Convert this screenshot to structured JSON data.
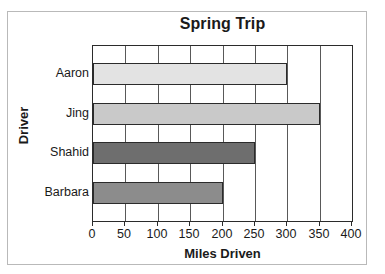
{
  "chart_data": {
    "type": "bar",
    "orientation": "horizontal",
    "title": "Spring Trip",
    "xlabel": "Miles Driven",
    "ylabel": "Driver",
    "categories": [
      "Aaron",
      "Jing",
      "Shahid",
      "Barbara"
    ],
    "values": [
      300,
      350,
      250,
      200
    ],
    "xlim": [
      0,
      400
    ],
    "xticks": [
      0,
      50,
      100,
      150,
      200,
      250,
      300,
      350,
      400
    ],
    "xtick_labels": [
      "0",
      "50",
      "100",
      "150",
      "200",
      "250",
      "300",
      "350",
      "400"
    ],
    "grid": "vertical",
    "legend": "none",
    "bar_colors": [
      "#e3e3e3",
      "#c9c9c9",
      "#6e6e6e",
      "#8c8c8c"
    ],
    "bar_edge_color": "#2b2b2b",
    "axis_color": "#2b2b2b",
    "gridline_color": "#595959",
    "frame_color": "#b9b9b9",
    "background": "#ffffff",
    "bars": [
      {
        "category": "Aaron",
        "value": 300,
        "color": "#e3e3e3"
      },
      {
        "category": "Jing",
        "value": 350,
        "color": "#c9c9c9"
      },
      {
        "category": "Shahid",
        "value": 250,
        "color": "#6e6e6e"
      },
      {
        "category": "Barbara",
        "value": 200,
        "color": "#8c8c8c"
      }
    ]
  }
}
